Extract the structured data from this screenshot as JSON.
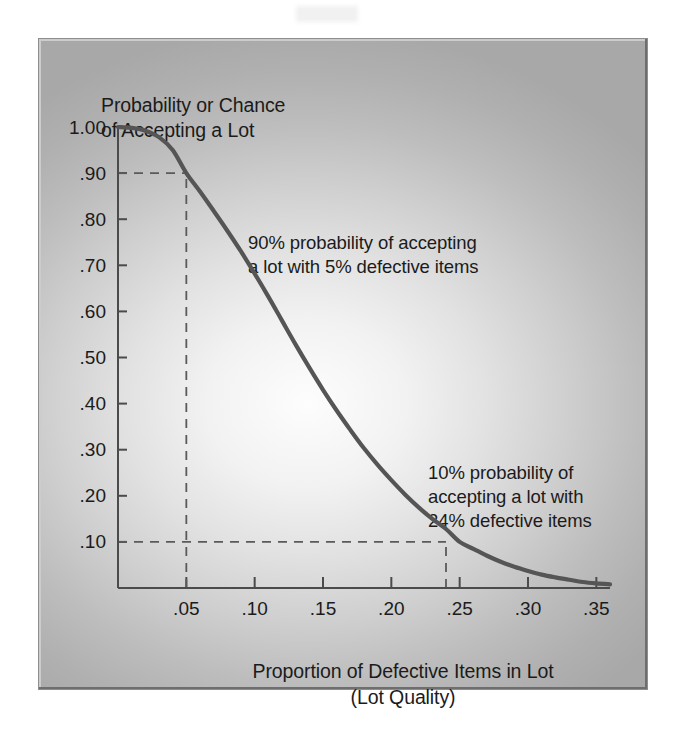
{
  "figure": {
    "y_caption": "Probability or Chance\nof Accepting a Lot",
    "x_caption": "Proportion of Defective Items in Lot\n(Lot Quality)",
    "annotation_90": "90% probability of accepting\na lot  with 5% defective items",
    "annotation_10": "10% probability of\naccepting a lot with\n24% defective items",
    "colors": {
      "curve": "#555555",
      "axis": "#4b4b4b",
      "guide": "#5a5a5a",
      "text": "#1b1b1b",
      "panel_light": "#fdfdfd",
      "panel_dark": "#a8a8a8",
      "page_background": "#ffffff"
    }
  },
  "chart_data": {
    "type": "line",
    "title": "",
    "xlabel": "Proportion of Defective Items in Lot (Lot Quality)",
    "ylabel": "Probability or Chance of Accepting a Lot",
    "xlim": [
      0.0,
      0.36
    ],
    "ylim": [
      0.0,
      1.0
    ],
    "grid": false,
    "legend": "none",
    "x_tick_labels": [
      ".05",
      ".10",
      ".15",
      ".20",
      ".25",
      ".30",
      ".35"
    ],
    "x_ticks": [
      0.05,
      0.1,
      0.15,
      0.2,
      0.25,
      0.3,
      0.35
    ],
    "y_tick_labels": [
      "1.00",
      ".90",
      ".80",
      ".70",
      ".60",
      ".50",
      ".40",
      ".30",
      ".20",
      ".10"
    ],
    "y_ticks": [
      1.0,
      0.9,
      0.8,
      0.7,
      0.6,
      0.5,
      0.4,
      0.3,
      0.2,
      0.1
    ],
    "series": [
      {
        "name": "Operating Characteristic Curve",
        "x": [
          0.0,
          0.01,
          0.02,
          0.03,
          0.04,
          0.05,
          0.06,
          0.07,
          0.08,
          0.09,
          0.1,
          0.11,
          0.12,
          0.13,
          0.14,
          0.15,
          0.16,
          0.17,
          0.18,
          0.19,
          0.2,
          0.21,
          0.22,
          0.23,
          0.24,
          0.25,
          0.26,
          0.27,
          0.28,
          0.29,
          0.3,
          0.31,
          0.32,
          0.33,
          0.34,
          0.35,
          0.36
        ],
        "y": [
          1.0,
          0.998,
          0.992,
          0.978,
          0.95,
          0.9,
          0.86,
          0.818,
          0.775,
          0.73,
          0.682,
          0.632,
          0.58,
          0.528,
          0.478,
          0.43,
          0.385,
          0.343,
          0.303,
          0.267,
          0.234,
          0.203,
          0.175,
          0.15,
          0.128,
          0.1,
          0.085,
          0.07,
          0.057,
          0.046,
          0.037,
          0.029,
          0.023,
          0.018,
          0.013,
          0.01,
          0.008
        ]
      }
    ],
    "annotations": [
      {
        "text": "90% probability of accepting a lot  with 5% defective items",
        "reference_point": {
          "x": 0.05,
          "y": 0.9
        },
        "guide": "dashed"
      },
      {
        "text": "10% probability of accepting a lot with 24% defective items",
        "reference_point": {
          "x": 0.24,
          "y": 0.1
        },
        "guide": "dashed"
      }
    ],
    "reference_lines": [
      {
        "type": "horizontal",
        "value": 0.9,
        "from_x": 0.0,
        "to_x": 0.05,
        "style": "dashed"
      },
      {
        "type": "vertical",
        "value": 0.05,
        "from_y": 0.0,
        "to_y": 0.9,
        "style": "dashed"
      },
      {
        "type": "horizontal",
        "value": 0.1,
        "from_x": 0.0,
        "to_x": 0.24,
        "style": "dashed"
      },
      {
        "type": "vertical",
        "value": 0.24,
        "from_y": 0.0,
        "to_y": 0.1,
        "style": "dashed"
      }
    ]
  }
}
